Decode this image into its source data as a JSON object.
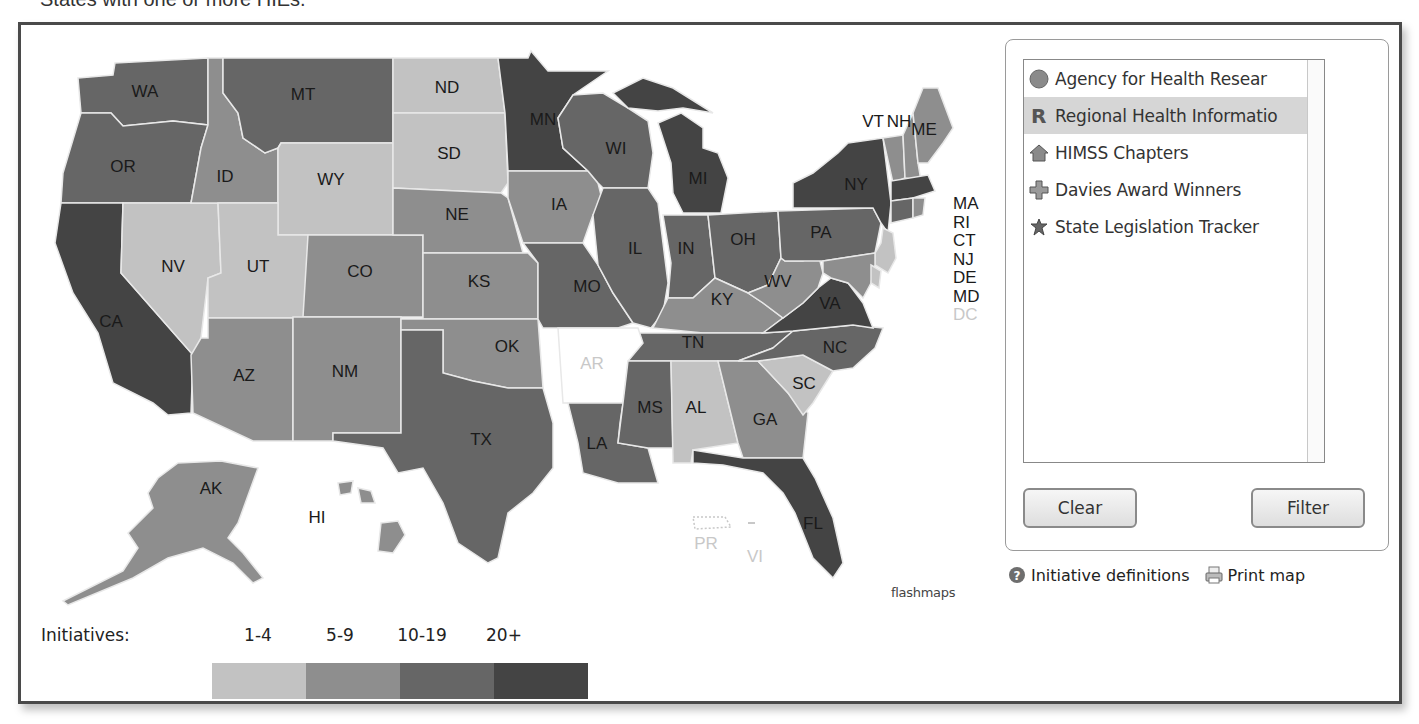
{
  "caption": "States with one or more HIEs.",
  "map": {
    "credit": "flashmaps",
    "colors": {
      "none": "#ffffff",
      "range_1_4": "#c2c2c2",
      "range_5_9": "#8e8e8e",
      "range_10_19": "#666666",
      "range_20_plus": "#444444",
      "border": "#e8e8e8"
    },
    "states": [
      {
        "abbr": "WA",
        "tier": "10-19"
      },
      {
        "abbr": "MT",
        "tier": "10-19"
      },
      {
        "abbr": "ND",
        "tier": "1-4"
      },
      {
        "abbr": "MN",
        "tier": "20+"
      },
      {
        "abbr": "OR",
        "tier": "10-19"
      },
      {
        "abbr": "ID",
        "tier": "5-9"
      },
      {
        "abbr": "WY",
        "tier": "1-4"
      },
      {
        "abbr": "SD",
        "tier": "1-4"
      },
      {
        "abbr": "WI",
        "tier": "10-19"
      },
      {
        "abbr": "MI",
        "tier": "20+"
      },
      {
        "abbr": "NE",
        "tier": "5-9"
      },
      {
        "abbr": "IA",
        "tier": "5-9"
      },
      {
        "abbr": "NV",
        "tier": "1-4"
      },
      {
        "abbr": "UT",
        "tier": "1-4"
      },
      {
        "abbr": "CO",
        "tier": "5-9"
      },
      {
        "abbr": "KS",
        "tier": "5-9"
      },
      {
        "abbr": "IL",
        "tier": "10-19"
      },
      {
        "abbr": "IN",
        "tier": "10-19"
      },
      {
        "abbr": "OH",
        "tier": "10-19"
      },
      {
        "abbr": "PA",
        "tier": "10-19"
      },
      {
        "abbr": "NY",
        "tier": "20+"
      },
      {
        "abbr": "CA",
        "tier": "20+"
      },
      {
        "abbr": "MO",
        "tier": "10-19"
      },
      {
        "abbr": "KY",
        "tier": "5-9"
      },
      {
        "abbr": "WV",
        "tier": "5-9"
      },
      {
        "abbr": "VA",
        "tier": "20+"
      },
      {
        "abbr": "AZ",
        "tier": "5-9"
      },
      {
        "abbr": "NM",
        "tier": "5-9"
      },
      {
        "abbr": "OK",
        "tier": "5-9"
      },
      {
        "abbr": "AR",
        "tier": "none"
      },
      {
        "abbr": "TN",
        "tier": "10-19"
      },
      {
        "abbr": "NC",
        "tier": "10-19"
      },
      {
        "abbr": "TX",
        "tier": "10-19"
      },
      {
        "abbr": "MS",
        "tier": "10-19"
      },
      {
        "abbr": "AL",
        "tier": "1-4"
      },
      {
        "abbr": "GA",
        "tier": "5-9"
      },
      {
        "abbr": "SC",
        "tier": "1-4"
      },
      {
        "abbr": "LA",
        "tier": "10-19"
      },
      {
        "abbr": "FL",
        "tier": "20+"
      },
      {
        "abbr": "AK",
        "tier": "5-9"
      },
      {
        "abbr": "HI",
        "tier": "5-9"
      },
      {
        "abbr": "ME",
        "tier": "5-9"
      },
      {
        "abbr": "VT",
        "tier": "5-9"
      },
      {
        "abbr": "NH",
        "tier": "5-9"
      },
      {
        "abbr": "MA",
        "tier": "20+"
      },
      {
        "abbr": "RI",
        "tier": "5-9"
      },
      {
        "abbr": "CT",
        "tier": "10-19"
      },
      {
        "abbr": "NJ",
        "tier": "1-4"
      },
      {
        "abbr": "DE",
        "tier": "1-4"
      },
      {
        "abbr": "MD",
        "tier": "5-9"
      },
      {
        "abbr": "DC",
        "tier": "none"
      },
      {
        "abbr": "PR",
        "tier": "none"
      },
      {
        "abbr": "VI",
        "tier": "none"
      }
    ],
    "side_labels": [
      "MA",
      "RI",
      "CT",
      "NJ",
      "DE",
      "MD",
      "DC"
    ]
  },
  "layers": {
    "items": [
      {
        "label": "Agency for Health Resear",
        "icon": "circle-icon",
        "selected": false
      },
      {
        "label": "Regional Health Informatio",
        "icon": "r-letter-icon",
        "selected": true
      },
      {
        "label": "HIMSS Chapters",
        "icon": "house-icon",
        "selected": false
      },
      {
        "label": "Davies Award Winners",
        "icon": "plus-icon",
        "selected": false
      },
      {
        "label": "State Legislation Tracker",
        "icon": "star-badge-icon",
        "selected": false
      }
    ],
    "clear_label": "Clear",
    "filter_label": "Filter"
  },
  "links": {
    "definitions_label": "Initiative definitions",
    "print_label": "Print map"
  },
  "legend": {
    "title": "Initiatives:",
    "ranges": [
      "1-4",
      "5-9",
      "10-19",
      "20+"
    ],
    "colors": [
      "#c2c2c2",
      "#8e8e8e",
      "#666666",
      "#444444"
    ]
  }
}
